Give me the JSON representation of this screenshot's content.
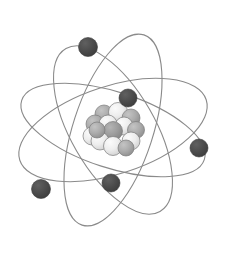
{
  "figure": {
    "background_color": "#ffffff",
    "width": 229,
    "height": 257
  },
  "palette": {
    "orbit_line": "#8a8a8a",
    "orbit_line_width": 1.1,
    "electron_fill": "#4a4a4a",
    "electron_stroke": "#3a3a3a",
    "nucleon_light": "#ebebeb",
    "nucleon_mid": "#a8a8a8",
    "nucleon_dark": "#9a9a9a",
    "nucleon_stroke": "#7b7b7b",
    "background": "#ffffff"
  },
  "nucleus": {
    "label": "nucleus",
    "center_x": 113,
    "center_y": 130,
    "nucleon_count": 14,
    "nucleons": [
      {
        "cx": 104,
        "cy": 114,
        "r": 9.0,
        "shade": "mid"
      },
      {
        "cx": 118,
        "cy": 112,
        "r": 9.5,
        "shade": "light"
      },
      {
        "cx": 131,
        "cy": 118,
        "r": 9.0,
        "shade": "mid"
      },
      {
        "cx": 95,
        "cy": 124,
        "r": 9.0,
        "shade": "mid"
      },
      {
        "cx": 108,
        "cy": 124,
        "r": 9.0,
        "shade": "light"
      },
      {
        "cx": 124,
        "cy": 126,
        "r": 9.0,
        "shade": "light"
      },
      {
        "cx": 136,
        "cy": 130,
        "r": 8.5,
        "shade": "mid"
      },
      {
        "cx": 92,
        "cy": 136,
        "r": 9.0,
        "shade": "light"
      },
      {
        "cx": 113,
        "cy": 131,
        "r": 9.5,
        "shade": "dark"
      },
      {
        "cx": 100,
        "cy": 141,
        "r": 9.0,
        "shade": "light"
      },
      {
        "cx": 131,
        "cy": 141,
        "r": 9.0,
        "shade": "light"
      },
      {
        "cx": 113,
        "cy": 146,
        "r": 9.5,
        "shade": "light"
      },
      {
        "cx": 97,
        "cy": 130,
        "r": 8.0,
        "shade": "mid"
      },
      {
        "cx": 126,
        "cy": 148,
        "r": 8.0,
        "shade": "mid"
      }
    ]
  },
  "orbits": [
    {
      "id": "orbit-1",
      "label": "orbit-steep-vertical",
      "rx": 40,
      "ry": 100,
      "rotation_deg": 18
    },
    {
      "id": "orbit-2",
      "label": "orbit-tilted-right",
      "rx": 44,
      "ry": 98,
      "rotation_deg": 72
    },
    {
      "id": "orbit-3",
      "label": "orbit-near-horizontal",
      "rx": 38,
      "ry": 96,
      "rotation_deg": 108
    },
    {
      "id": "orbit-4",
      "label": "orbit-tilted-left",
      "rx": 42,
      "ry": 94,
      "rotation_deg": 150
    }
  ],
  "electrons": [
    {
      "id": "electron-top",
      "label": "electron 1",
      "cx": 88,
      "cy": 47,
      "r": 9.5
    },
    {
      "id": "electron-upper-middle",
      "label": "electron 2",
      "cx": 128,
      "cy": 98,
      "r": 9.0
    },
    {
      "id": "electron-right",
      "label": "electron 3",
      "cx": 199,
      "cy": 148,
      "r": 9.0
    },
    {
      "id": "electron-lower-center",
      "label": "electron 4",
      "cx": 111,
      "cy": 183,
      "r": 9.0
    },
    {
      "id": "electron-lower-left",
      "label": "electron 5",
      "cx": 41,
      "cy": 189,
      "r": 9.5
    }
  ]
}
